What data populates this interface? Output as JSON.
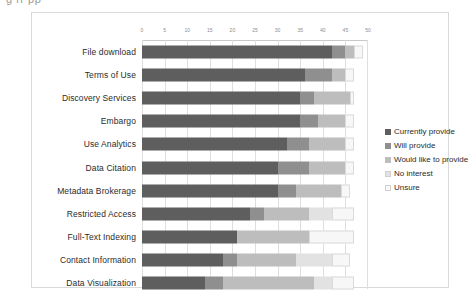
{
  "caption": {
    "fragment": "g    rr    pp"
  },
  "chart_data": {
    "type": "bar",
    "orientation": "horizontal",
    "stacked": true,
    "title": "",
    "xlabel": "",
    "ylabel": "",
    "xlim": [
      0,
      50
    ],
    "xticks": [
      "0",
      "5",
      "10",
      "15",
      "20",
      "25",
      "30",
      "35",
      "40",
      "45",
      "50"
    ],
    "grid": true,
    "legend_position": "right",
    "categories": [
      "File download",
      "Terms of Use",
      "Discovery Services",
      "Embargo",
      "Use Analytics",
      "Data Citation",
      "Metadata Brokerage",
      "Restricted Access",
      "Full-Text Indexing",
      "Contact Information",
      "Data Visualization"
    ],
    "series": [
      {
        "name": "Currently provide",
        "values": [
          42,
          36,
          35,
          35,
          32,
          30,
          30,
          24,
          21,
          18,
          14
        ]
      },
      {
        "name": "Will provide",
        "values": [
          3,
          6,
          3,
          4,
          5,
          7,
          4,
          3,
          0,
          3,
          4
        ]
      },
      {
        "name": "Would like to provide",
        "values": [
          2,
          3,
          8,
          6,
          8,
          8,
          10,
          10,
          16,
          13,
          20
        ]
      },
      {
        "name": "No interest",
        "values": [
          0,
          0,
          0,
          0,
          0,
          0,
          0,
          5,
          0,
          8,
          4
        ]
      },
      {
        "name": "Unsure",
        "values": [
          2,
          2,
          1,
          2,
          2,
          2,
          2,
          5,
          10,
          4,
          5
        ]
      }
    ],
    "colors": [
      "#5e5e5e",
      "#8f8f8f",
      "#bdbdbd",
      "#e2e2e2",
      "#f7f7f7"
    ]
  }
}
